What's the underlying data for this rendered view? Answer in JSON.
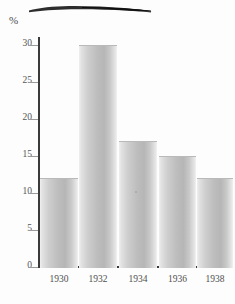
{
  "chart_data": {
    "type": "bar",
    "title": "",
    "subtitle": "",
    "xlabel": "",
    "ylabel": "%",
    "unit_label": "%",
    "categories": [
      "1930",
      "1932",
      "1934",
      "1936",
      "1938"
    ],
    "values": [
      12,
      30,
      17,
      15,
      12
    ],
    "series": [
      {
        "name": "",
        "values": [
          12,
          30,
          17,
          15,
          12
        ]
      }
    ],
    "ylim": [
      0,
      30
    ],
    "y_ticks": [
      0,
      5,
      10,
      15,
      20,
      25,
      30
    ],
    "y_tick_labels": [
      "0",
      "5",
      "10",
      "15",
      "20",
      "25",
      "30"
    ],
    "grid": false,
    "legend": "none",
    "bar_color": "#c2c2c2",
    "axis_color": "#3a3a3a",
    "text_color": "#4f4f4f",
    "annotations": [
      {
        "name": "top-smudge",
        "text": "",
        "description": "dark horizontal ink brush smudge across the top margin"
      }
    ]
  },
  "bars": [
    {
      "label": "1930",
      "value": 12,
      "value_text": "12"
    },
    {
      "label": "1932",
      "value": 30,
      "value_text": "30"
    },
    {
      "label": "1934",
      "value": 17,
      "value_text": "17"
    },
    {
      "label": "1936",
      "value": 15,
      "value_text": "15"
    },
    {
      "label": "1938",
      "value": 12,
      "value_text": "12"
    }
  ],
  "y_axis": {
    "unit": "%",
    "ticks": [
      {
        "value": 30,
        "label": "30"
      },
      {
        "value": 25,
        "label": "25"
      },
      {
        "value": 20,
        "label": "20"
      },
      {
        "value": 15,
        "label": "15"
      },
      {
        "value": 10,
        "label": "10"
      },
      {
        "value": 5,
        "label": "5"
      },
      {
        "value": 0,
        "label": "0"
      }
    ]
  }
}
